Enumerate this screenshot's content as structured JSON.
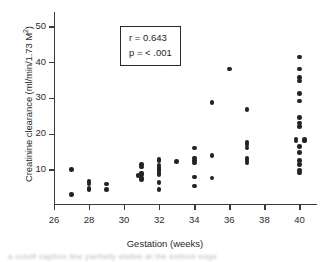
{
  "chart_data": {
    "type": "scatter",
    "title": "",
    "xlabel": "Gestation (weeks)",
    "ylabel": "Creatinine clearance (ml/min/1.73 M²)",
    "ylabel_main": "Creatinine clearance (ml/min/1.73 M",
    "ylabel_sup": "2",
    "ylabel_tail": ")",
    "xlim": [
      26,
      41
    ],
    "ylim": [
      0,
      54
    ],
    "xticks": [
      26,
      28,
      30,
      32,
      34,
      36,
      38,
      40
    ],
    "yticks": [
      10,
      20,
      30,
      40,
      50
    ],
    "grid": false,
    "legend": null,
    "annotations": {
      "r_label": "r = 0.643",
      "p_label": "p = < .001",
      "r_value": 0.643,
      "p_value": "< .001"
    },
    "marker": {
      "shape": "circle",
      "color": "#232323",
      "size_px": 4.6
    },
    "points": [
      {
        "x": 27.0,
        "y": 10.0
      },
      {
        "x": 27.0,
        "y": 3.0
      },
      {
        "x": 28.0,
        "y": 6.5
      },
      {
        "x": 28.0,
        "y": 5.9
      },
      {
        "x": 28.0,
        "y": 4.6
      },
      {
        "x": 28.0,
        "y": 4.2
      },
      {
        "x": 29.0,
        "y": 5.9
      },
      {
        "x": 29.0,
        "y": 4.3
      },
      {
        "x": 31.0,
        "y": 11.3
      },
      {
        "x": 31.0,
        "y": 10.6
      },
      {
        "x": 31.0,
        "y": 9.0
      },
      {
        "x": 31.0,
        "y": 8.6
      },
      {
        "x": 30.8,
        "y": 8.3
      },
      {
        "x": 31.0,
        "y": 7.6
      },
      {
        "x": 31.0,
        "y": 7.2
      },
      {
        "x": 32.0,
        "y": 12.7
      },
      {
        "x": 32.0,
        "y": 12.3
      },
      {
        "x": 32.0,
        "y": 11.2
      },
      {
        "x": 32.0,
        "y": 10.6
      },
      {
        "x": 32.0,
        "y": 10.2
      },
      {
        "x": 32.0,
        "y": 9.6
      },
      {
        "x": 32.0,
        "y": 9.0
      },
      {
        "x": 32.0,
        "y": 8.6
      },
      {
        "x": 32.0,
        "y": 6.3
      },
      {
        "x": 32.0,
        "y": 4.4
      },
      {
        "x": 33.0,
        "y": 12.2
      },
      {
        "x": 34.0,
        "y": 16.0
      },
      {
        "x": 34.0,
        "y": 13.2
      },
      {
        "x": 34.0,
        "y": 12.4
      },
      {
        "x": 34.0,
        "y": 11.8
      },
      {
        "x": 34.0,
        "y": 7.8
      },
      {
        "x": 34.0,
        "y": 5.3
      },
      {
        "x": 35.0,
        "y": 28.7
      },
      {
        "x": 35.0,
        "y": 13.9
      },
      {
        "x": 35.0,
        "y": 7.6
      },
      {
        "x": 36.0,
        "y": 38.1
      },
      {
        "x": 37.0,
        "y": 26.8
      },
      {
        "x": 37.0,
        "y": 17.5
      },
      {
        "x": 37.0,
        "y": 16.8
      },
      {
        "x": 37.0,
        "y": 15.9
      },
      {
        "x": 37.0,
        "y": 13.0
      },
      {
        "x": 37.0,
        "y": 12.3
      },
      {
        "x": 37.0,
        "y": 11.7
      },
      {
        "x": 40.0,
        "y": 41.4
      },
      {
        "x": 40.0,
        "y": 38.1
      },
      {
        "x": 40.0,
        "y": 35.6
      },
      {
        "x": 40.0,
        "y": 34.7
      },
      {
        "x": 40.0,
        "y": 31.2
      },
      {
        "x": 40.0,
        "y": 29.1
      },
      {
        "x": 40.0,
        "y": 24.4
      },
      {
        "x": 40.0,
        "y": 22.9
      },
      {
        "x": 40.0,
        "y": 22.0
      },
      {
        "x": 39.8,
        "y": 18.5
      },
      {
        "x": 40.3,
        "y": 18.4
      },
      {
        "x": 39.8,
        "y": 17.9
      },
      {
        "x": 40.3,
        "y": 17.9
      },
      {
        "x": 40.0,
        "y": 16.4
      },
      {
        "x": 40.0,
        "y": 14.7
      },
      {
        "x": 40.0,
        "y": 12.4
      },
      {
        "x": 40.0,
        "y": 11.3
      },
      {
        "x": 40.0,
        "y": 9.6
      },
      {
        "x": 40.0,
        "y": 8.9
      }
    ]
  },
  "caption_fragment": "a  cutoff  caption  line  partially  visible  at  the  bottom  edge"
}
